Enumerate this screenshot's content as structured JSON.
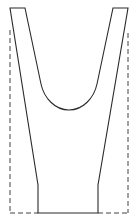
{
  "diagram": {
    "title": "",
    "colors": {
      "background": "#ffffff",
      "stroke": "#2a2a2a",
      "dashed_stroke": "#444444"
    },
    "shapes": {
      "fork_profile": {
        "style": "solid",
        "points": [
          [
            10,
            8
          ],
          [
            25,
            8
          ],
          [
            42,
            88
          ],
          [
            69,
            110
          ],
          [
            96,
            88
          ],
          [
            113,
            8
          ],
          [
            128,
            8
          ],
          [
            98,
            185
          ],
          [
            98,
            213
          ],
          [
            38,
            213
          ],
          [
            38,
            185
          ],
          [
            10,
            8
          ]
        ]
      },
      "stock_outline": {
        "style": "dashed",
        "left_edge": [
          [
            10,
            30
          ],
          [
            10,
            213
          ]
        ],
        "right_edge": [
          [
            128,
            33
          ],
          [
            128,
            213
          ]
        ],
        "bottom_left": [
          [
            10,
            213
          ],
          [
            38,
            213
          ]
        ],
        "bottom_right": [
          [
            98,
            213
          ],
          [
            128,
            213
          ]
        ]
      }
    },
    "labels": []
  }
}
